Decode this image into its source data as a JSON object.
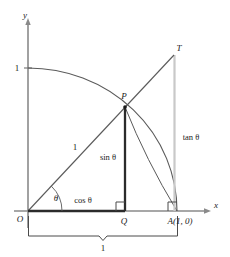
{
  "figure": {
    "colors": {
      "axis": "#8a8a8a",
      "curve": "#555555",
      "heavy_line": "#2b2b2b",
      "tangent_line": "#c9c9c9",
      "text": "#1a1a1a",
      "bracket": "#4a4a4a",
      "background": "#ffffff"
    },
    "axes": {
      "x_label": "x",
      "y_label": "y",
      "origin_label": "O"
    },
    "points": [
      {
        "key": "origin",
        "label": "O",
        "x": 28,
        "y": 211
      },
      {
        "key": "P",
        "label": "P",
        "x": 125,
        "y": 107
      },
      {
        "key": "Q",
        "label": "Q",
        "x": 125,
        "y": 211
      },
      {
        "key": "A",
        "label": "A(1, 0)",
        "x": 177,
        "y": 211
      },
      {
        "key": "T",
        "label": "T",
        "x": 174,
        "y": 55
      },
      {
        "key": "unit_y",
        "label": "1",
        "x": 28,
        "y": 68
      }
    ],
    "labels": {
      "y_tick_one": "1",
      "radius_one": "1",
      "angle_theta": "θ",
      "cos_theta": "cos θ",
      "sin_theta": "sin θ",
      "tan_theta": "tan θ",
      "bracket_one": "1",
      "point_P": "P",
      "point_Q": "Q",
      "point_T": "T",
      "point_A": "A(1, 0)",
      "point_O": "O",
      "axis_x": "x",
      "axis_y": "y"
    },
    "geometry": {
      "radius_px": 149,
      "theta_degrees": 47,
      "unit_length_label": "1",
      "right_angle_markers": [
        {
          "at": "Q",
          "x": 125,
          "y": 211
        },
        {
          "at": "A",
          "x": 177,
          "y": 211
        }
      ]
    }
  }
}
